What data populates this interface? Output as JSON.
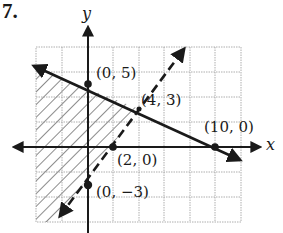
{
  "problem_number": "7.",
  "axes": {
    "x_label": "x",
    "y_label": "y"
  },
  "points": [
    {
      "label": "(0, 5)",
      "x": 0,
      "y": 5
    },
    {
      "label": "(4, 3)",
      "x": 4,
      "y": 3
    },
    {
      "label": "(10, 0)",
      "x": 10,
      "y": 0
    },
    {
      "label": "(2, 0)",
      "x": 2,
      "y": 0
    },
    {
      "label": "(0, −3)",
      "x": 0,
      "y": -3
    }
  ],
  "lines": [
    {
      "name": "solid-boundary",
      "style": "solid",
      "through": [
        [
          0,
          5
        ],
        [
          10,
          0
        ]
      ],
      "equation": "x + 2y = 10"
    },
    {
      "name": "dashed-boundary",
      "style": "dashed",
      "through": [
        [
          2,
          0
        ],
        [
          0,
          -3
        ]
      ],
      "equation": "3x - 2y = 6"
    }
  ],
  "shaded_region": {
    "pattern": "diagonal-hatch",
    "description": "below solid line and left of dashed line"
  },
  "grid": {
    "x_range": [
      -4,
      12
    ],
    "y_range": [
      -6,
      8
    ],
    "step": 2
  },
  "colors": {
    "ink": "#1a1a1a",
    "grid": "#9a9a9a",
    "background": "#ffffff"
  }
}
